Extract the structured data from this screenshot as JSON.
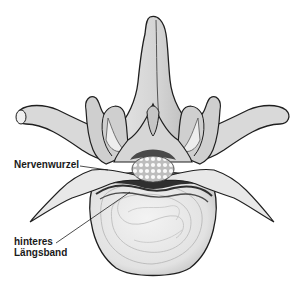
{
  "figure": {
    "colors": {
      "bone_light": "#e4e4e4",
      "bone_mid": "#c8c8c8",
      "bone_dark": "#a8a8a8",
      "outline": "#1f1f1f",
      "disc": "#ececec",
      "ligament": "#3a3a3a",
      "spinal_cord": "#f4f4f4",
      "background": "#ffffff"
    }
  },
  "labels": [
    {
      "id": "nerve-root",
      "text": "Nervenwurzel"
    },
    {
      "id": "posterior-longitudinal-ligament",
      "line1": "hinteres",
      "line2": "Längsband"
    }
  ]
}
